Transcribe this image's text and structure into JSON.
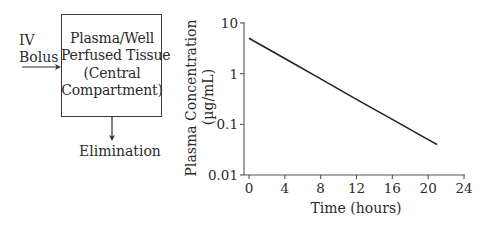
{
  "diagram": {
    "input_label_line1": "IV",
    "input_label_line2": "Bolus",
    "compartment_lines": [
      "Plasma/Well",
      "Perfused Tissue",
      "(Central",
      "Compartment)"
    ],
    "output_label": "Elimination"
  },
  "chart_data": {
    "type": "line",
    "title": "",
    "xlabel": "Time (hours)",
    "ylabel": "Plasma Concentration (µg/mL)",
    "ylabel_line1": "Plasma Concentration",
    "ylabel_line2": "(µg/mL)",
    "yscale": "log",
    "xlim": [
      0,
      24
    ],
    "ylim": [
      0.01,
      10
    ],
    "x_ticks": [
      0,
      4,
      8,
      12,
      16,
      20,
      24
    ],
    "x_tick_labels": [
      "0",
      "4",
      "8",
      "12",
      "16",
      "20",
      "24"
    ],
    "y_ticks": [
      10,
      1,
      0.1,
      0.01
    ],
    "y_tick_labels": [
      "10",
      "1",
      "0.1",
      "0.01"
    ],
    "grid": false,
    "legend": null,
    "series": [
      {
        "name": "IV bolus, one-compartment",
        "x": [
          0,
          4,
          8,
          12,
          16,
          20,
          21
        ],
        "y": [
          5.0,
          1.99,
          0.79,
          0.31,
          0.125,
          0.05,
          0.04
        ]
      }
    ]
  }
}
